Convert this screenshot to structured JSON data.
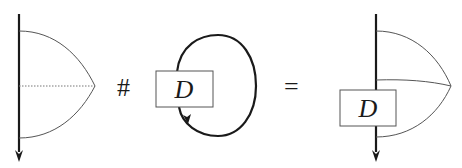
{
  "diagram": {
    "left_figure": {
      "description": "vertical strand with theta-graph arcs"
    },
    "operator_hash": "#",
    "middle_figure": {
      "box_label": "D",
      "description": "closed loop through box D"
    },
    "operator_equals": "=",
    "right_figure": {
      "box_label": "D",
      "description": "vertical strand through box D with arcs"
    },
    "colors": {
      "strand": "#1a1a1a",
      "arc": "#555555"
    }
  }
}
